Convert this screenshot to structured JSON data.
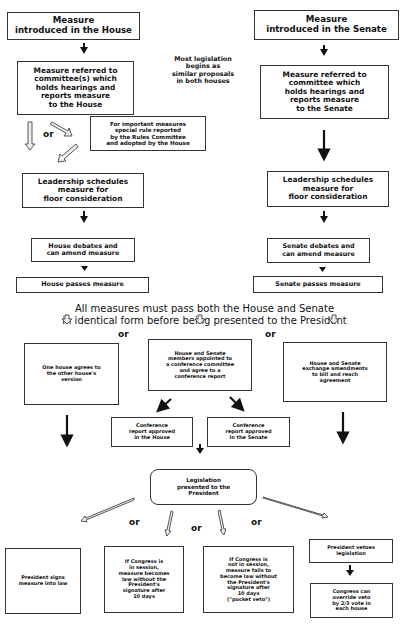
{
  "house": {
    "introduced": "Measure\nintroduced in the House",
    "committee": "Measure referred to\ncommittee(s) which\nholds hearings and\nreports measure\nto the House",
    "rules": "For important measures\nspecial rule reported\nby the Rules Committee\nand adopted by the House",
    "leadership": "Leadership schedules\nmeasure for\nfloor consideration",
    "debate": "House debates and\ncan amend measure",
    "passes": "House passes measure"
  },
  "senate": {
    "introduced": "Measure\nintroduced in the Senate",
    "committee": "Measure referred to\ncommittee which\nholds hearings and\nreports measure\nto the Senate",
    "leadership": "Leadership schedules\nmeasure for\nfloor consideration",
    "debate": "Senate debates and\ncan amend measure",
    "passes": "Senate passes measure"
  },
  "note_similar": "Most legislation\nbegins as\nsimilar proposals\nin both houses",
  "requirement": "All measures must pass both the House and Senate\nin identical form before being presented to the President",
  "reconcile": {
    "option_a": "One house agrees to\nthe other house's\nversion",
    "option_b": "House and Senate\nmembers appointed to\na conference committee\nand agree to a\nconference report",
    "option_c": "House and Senate\nexchange amendments\nto bill and reach\nagreement",
    "conf_house": "Conference\nreport approved\nin the House",
    "conf_senate": "Conference\nreport approved\nin the Senate"
  },
  "president": {
    "presented": "Legislation\npresented to the\nPresident",
    "signs": "President signs\nmeasure into law",
    "in_session": "If Congress is\nin session,\nmeasure becomes\nlaw without the\nPresident's\nsignature after\n10 days",
    "not_in_session": "If Congress is\nnot in session,\nmeasure fails to\nbecome law without\nthe President's\nsignature after\n10 days\n(\"pocket veto\")",
    "vetoes": "President vetoes\nlegislation",
    "override": "Congress can\noverride veto\nby 2/3 vote in\neach house"
  },
  "connector_or": "or"
}
